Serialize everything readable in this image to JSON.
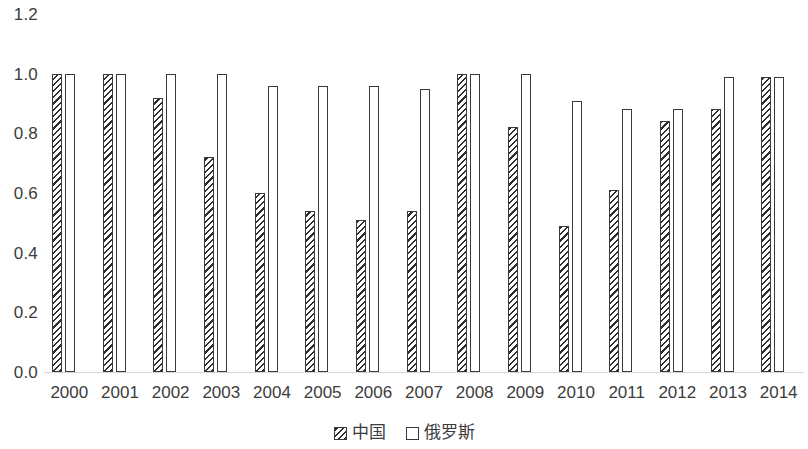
{
  "chart_data": {
    "type": "bar",
    "title": "",
    "subtitle": "",
    "xlabel": "",
    "ylabel": "",
    "categories": [
      "2000",
      "2001",
      "2002",
      "2003",
      "2004",
      "2005",
      "2006",
      "2007",
      "2008",
      "2009",
      "2010",
      "2011",
      "2012",
      "2013",
      "2014"
    ],
    "series": [
      {
        "name": "中国",
        "values": [
          1.0,
          1.0,
          0.92,
          0.72,
          0.6,
          0.54,
          0.51,
          0.54,
          1.0,
          0.82,
          0.49,
          0.61,
          0.84,
          0.88,
          0.99
        ]
      },
      {
        "name": "俄罗斯",
        "values": [
          1.0,
          1.0,
          1.0,
          1.0,
          0.96,
          0.96,
          0.96,
          0.95,
          1.0,
          1.0,
          0.91,
          0.88,
          0.88,
          0.99,
          0.99
        ]
      }
    ],
    "ylim": [
      0.0,
      1.2
    ],
    "y_ticks": [
      "1.2",
      "1.0",
      "0.8",
      "0.6",
      "0.4",
      "0.2",
      "0.0"
    ],
    "y_tick_values": [
      1.2,
      1.0,
      0.8,
      0.6,
      0.4,
      0.2,
      0.0
    ],
    "grid": false,
    "legend_position": "bottom",
    "legend": [
      "中国",
      "俄罗斯"
    ],
    "colors": {
      "bar_outline": "#3a3a3a",
      "hatch": "#2e2e2e",
      "fill": "#ffffff",
      "text": "#3c3c3c",
      "axis_line": "#d7d7d7",
      "background": "#ffffff"
    }
  }
}
